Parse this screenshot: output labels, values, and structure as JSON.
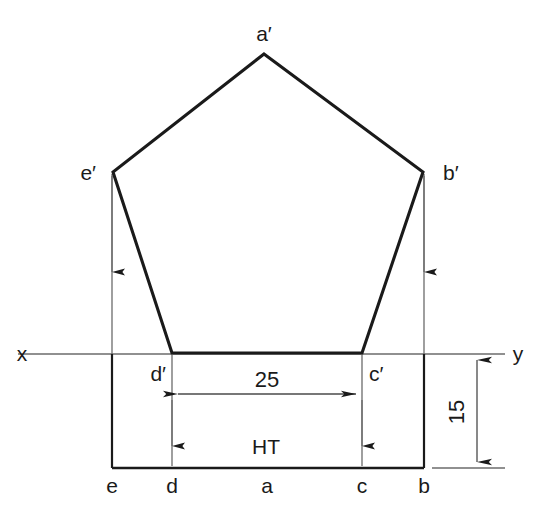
{
  "figure": {
    "background_color": "#ffffff",
    "stroke_color": "#1a1a1a",
    "thin_stroke_color": "#5a5a5a",
    "width": 552,
    "height": 513
  },
  "labels": {
    "apex": "a′",
    "right_upper": "b′",
    "left_upper": "e′",
    "right_lower": "c′",
    "left_lower": "d′",
    "top_e": "e",
    "top_d": "d",
    "top_a": "a",
    "top_c": "c",
    "top_b": "b",
    "ht": "HT",
    "axis_x": "x",
    "axis_y": "y"
  },
  "dimensions": {
    "horizontal_value": "25",
    "vertical_value": "15"
  },
  "geometry": {
    "front_view_vertices": [
      {
        "name": "a'",
        "x": 264,
        "y": 54
      },
      {
        "name": "b'",
        "x": 423,
        "y": 172
      },
      {
        "name": "c'",
        "x": 362,
        "y": 353
      },
      {
        "name": "d'",
        "x": 172,
        "y": 353
      },
      {
        "name": "e'",
        "x": 113,
        "y": 172
      }
    ],
    "top_view_points": [
      {
        "name": "e",
        "x": 112,
        "y": 468
      },
      {
        "name": "d",
        "x": 172,
        "y": 468
      },
      {
        "name": "a",
        "x": 267,
        "y": 468
      },
      {
        "name": "c",
        "x": 362,
        "y": 468
      },
      {
        "name": "b",
        "x": 424,
        "y": 468
      }
    ],
    "xy_line": {
      "x1": 18,
      "y1": 354,
      "x2": 505,
      "y2": 354
    },
    "horizontal_dim_line": {
      "x1": 172,
      "x2": 362,
      "y": 394
    },
    "vertical_dim_line": {
      "x": 477,
      "y1": 355,
      "y2": 468
    },
    "bottom_extension_line": {
      "x1": 432,
      "x2": 505,
      "y": 468
    }
  }
}
